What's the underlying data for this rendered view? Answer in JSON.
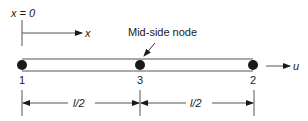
{
  "diagram": {
    "type": "one-dimensional quadratic bar element",
    "origin_label": "x = 0",
    "axis_label": "x",
    "displacement_label": "u",
    "callout_label": "Mid-side node",
    "nodes": [
      {
        "id": "1",
        "label": "1",
        "x": 22
      },
      {
        "id": "3",
        "label": "3",
        "x": 140
      },
      {
        "id": "2",
        "label": "2",
        "x": 253
      }
    ],
    "dimensions": [
      {
        "label": "l/2",
        "from": "1",
        "to": "3"
      },
      {
        "label": "l/2",
        "from": "3",
        "to": "2"
      }
    ],
    "colors": {
      "ink": "#1a1a1a",
      "bar_line": "#555555",
      "background": "#ffffff"
    }
  }
}
